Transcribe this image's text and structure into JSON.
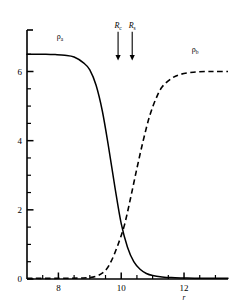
{
  "chart_data": {
    "type": "line",
    "title": "",
    "subtitle": "",
    "xlabel": "r",
    "ylabel": "",
    "xlim": [
      7.0,
      13.4
    ],
    "ylim": [
      0,
      7.2
    ],
    "grid": false,
    "legend_position": "inline-curve-labels",
    "x_ticks_major": [
      8,
      10,
      12
    ],
    "x_tick_labels": [
      "8",
      "10",
      "12"
    ],
    "x_ticks_minor": [
      7.5,
      8.5,
      9,
      9.5,
      10.5,
      11,
      11.5,
      12.5,
      13
    ],
    "y_ticks_major": [
      0,
      2,
      4,
      6
    ],
    "y_tick_labels": [
      "0",
      "2",
      "4",
      "6"
    ],
    "y_ticks_minor": [
      0.5,
      1,
      1.5,
      2.5,
      3,
      3.5,
      4.5,
      5,
      5.5,
      6.5
    ],
    "series": [
      {
        "name": "rho_a",
        "label_base": "ρ",
        "label_sub": "a",
        "style": "solid",
        "color": "#000000",
        "plateau_value": 6.5,
        "midpoint_x": 9.85,
        "steepness": 2.6,
        "direction": "descending",
        "label_x": 8.05,
        "label_y": 6.95,
        "x": [
          7.0,
          7.3,
          7.6,
          7.9,
          8.2,
          8.5,
          8.8,
          9.0,
          9.2,
          9.4,
          9.6,
          9.8,
          10.0,
          10.2,
          10.4,
          10.6,
          10.8,
          11.0,
          11.3,
          11.6,
          12.0,
          12.5,
          13.0,
          13.4
        ],
        "y": [
          6.5,
          6.5,
          6.5,
          6.49,
          6.47,
          6.42,
          6.25,
          6.05,
          5.6,
          4.85,
          3.8,
          2.65,
          1.6,
          0.92,
          0.5,
          0.28,
          0.16,
          0.1,
          0.06,
          0.04,
          0.03,
          0.02,
          0.02,
          0.02
        ]
      },
      {
        "name": "rho_b",
        "label_base": "ρ",
        "label_sub": "b",
        "style": "dashed",
        "color": "#000000",
        "plateau_value": 6.0,
        "midpoint_x": 10.6,
        "steepness": 2.2,
        "direction": "ascending",
        "label_x": 12.35,
        "label_y": 6.55,
        "x": [
          7.0,
          8.0,
          8.8,
          9.2,
          9.5,
          9.7,
          9.9,
          10.1,
          10.3,
          10.5,
          10.7,
          10.9,
          11.1,
          11.3,
          11.6,
          11.9,
          12.3,
          12.7,
          13.0,
          13.4
        ],
        "y": [
          0.02,
          0.02,
          0.03,
          0.08,
          0.25,
          0.55,
          1.0,
          1.55,
          2.35,
          3.2,
          4.0,
          4.7,
          5.2,
          5.55,
          5.8,
          5.92,
          5.98,
          6.0,
          6.0,
          6.0
        ]
      }
    ],
    "crossing_point": {
      "x": 10.12,
      "y": 1.22
    },
    "annotations": [
      {
        "name": "R_c",
        "label_base": "R",
        "label_sub": "c",
        "type": "down-arrow",
        "x": 9.9,
        "y_top": 7.15,
        "y_bottom": 6.35
      },
      {
        "name": "R_s",
        "label_base": "R",
        "label_sub": "s",
        "type": "down-arrow",
        "x": 10.35,
        "y_top": 7.15,
        "y_bottom": 6.35
      }
    ]
  },
  "axis": {
    "x_label": "r",
    "tick_8": "8",
    "tick_10": "10",
    "tick_12": "12",
    "tick_0": "0",
    "tick_2": "2",
    "tick_4": "4",
    "tick_6": "6"
  },
  "labels": {
    "rho_a_base": "ρ",
    "rho_a_sub": "a",
    "rho_b_base": "ρ",
    "rho_b_sub": "b",
    "R_c_base": "R",
    "R_c_sub": "c",
    "R_s_base": "R",
    "R_s_sub": "s"
  },
  "colors": {
    "ink": "#000000",
    "background": "#ffffff"
  }
}
